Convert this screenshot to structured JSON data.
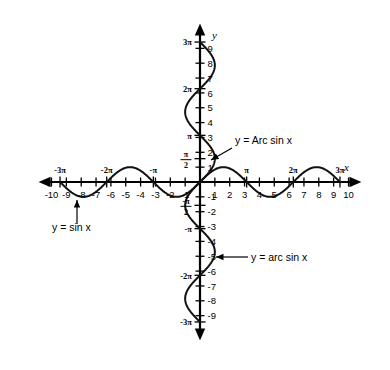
{
  "figure": {
    "background_color": "#ffffff",
    "curve_color": "#111111",
    "axis_color": "#000000"
  },
  "axes": {
    "x_axis_label": "x",
    "y_axis_label": "y",
    "x_range": [
      -10.8,
      10.8
    ],
    "y_range": [
      -10.6,
      10.6
    ],
    "x_integer_ticks": [
      -10,
      -9,
      -8,
      -7,
      -6,
      -5,
      -4,
      -3,
      -2,
      -1,
      1,
      2,
      3,
      4,
      5,
      6,
      7,
      8,
      9,
      10
    ],
    "y_integer_ticks": [
      -9,
      -8,
      -7,
      -6,
      -5,
      -4,
      -3,
      -2,
      -1,
      1,
      2,
      3,
      4,
      5,
      6,
      7,
      8,
      9
    ],
    "x_integer_tick_labels": [
      "-10",
      "-9",
      "-8",
      "-7",
      "-6",
      "-5",
      "-4",
      "-3",
      "-2",
      "-1",
      "1",
      "2",
      "3",
      "4",
      "5",
      "6",
      "7",
      "8",
      "9",
      "10"
    ],
    "y_integer_tick_labels": [
      "-9",
      "-8",
      "-7",
      "-6",
      "-5",
      "-4",
      "-3",
      "-2",
      "-1",
      "1",
      "2",
      "3",
      "4",
      "5",
      "6",
      "7",
      "8",
      "9"
    ],
    "x_pi_ticks": [
      {
        "value": -9.4248,
        "label": "-3π"
      },
      {
        "value": -6.2832,
        "label": "-2π"
      },
      {
        "value": -3.1416,
        "label": "-π"
      },
      {
        "value": 3.1416,
        "label": "π"
      },
      {
        "value": 6.2832,
        "label": "2π"
      },
      {
        "value": 9.4248,
        "label": "3π"
      }
    ],
    "y_pi_ticks": [
      {
        "value": -9.4248,
        "label": "-3π",
        "type": "plain"
      },
      {
        "value": -6.2832,
        "label": "-2π",
        "type": "plain"
      },
      {
        "value": -3.1416,
        "label": "-π",
        "type": "plain"
      },
      {
        "value": -1.5708,
        "label": "-π/2",
        "numerator": "-π",
        "denominator": "2",
        "type": "fraction"
      },
      {
        "value": 1.5708,
        "label": "π/2",
        "numerator": "π",
        "denominator": "2",
        "type": "fraction"
      },
      {
        "value": 3.1416,
        "label": "π",
        "type": "plain"
      },
      {
        "value": 6.2832,
        "label": "2π",
        "type": "plain"
      },
      {
        "value": 9.4248,
        "label": "3π",
        "type": "plain"
      }
    ]
  },
  "callouts": [
    {
      "id": "arcsin-principal",
      "text": "y = Arc sin x",
      "text_x": 235,
      "text_y": 144,
      "leader_from": [
        232,
        148
      ],
      "leader_to": [
        211,
        160
      ],
      "arrow_at": [
        211,
        160
      ],
      "arrow_angle": 150
    },
    {
      "id": "sine",
      "text": "y = sin x",
      "text_x": 52,
      "text_y": 231,
      "leader_from": [
        77,
        224
      ],
      "leader_to": [
        77,
        200
      ],
      "arrow_at": [
        77,
        200
      ],
      "arrow_angle": -90
    },
    {
      "id": "arcsin-relation",
      "text": "y = arc sin x",
      "text_x": 251,
      "text_y": 261,
      "leader_from": [
        248,
        257
      ],
      "leader_to": [
        216,
        257
      ],
      "arrow_at": [
        216,
        257
      ],
      "arrow_angle": 180
    }
  ],
  "chart_data": {
    "type": "line",
    "xlabel": "x",
    "ylabel": "y",
    "xlim": [
      -10.8,
      10.8
    ],
    "ylim": [
      -10.6,
      10.6
    ],
    "grid": false,
    "legend": "inline-callouts",
    "series": [
      {
        "name": "y = sin x",
        "equation": "y = sin x",
        "description": "Sine wave, amplitude 1, period 2π, drawn from x = -3π to x = 3π",
        "domain": [
          -9.4248,
          9.4248
        ],
        "range": [
          -1,
          1
        ],
        "amplitude": 1,
        "period": 6.2832,
        "key_points": [
          {
            "x": -9.4248,
            "y": 0
          },
          {
            "x": -7.854,
            "y": -1
          },
          {
            "x": -6.2832,
            "y": 0
          },
          {
            "x": -4.712,
            "y": 1
          },
          {
            "x": -3.1416,
            "y": 0
          },
          {
            "x": -1.5708,
            "y": -1
          },
          {
            "x": 0,
            "y": 0
          },
          {
            "x": 1.5708,
            "y": 1
          },
          {
            "x": 3.1416,
            "y": 0
          },
          {
            "x": 4.712,
            "y": -1
          },
          {
            "x": 6.2832,
            "y": 0
          },
          {
            "x": 7.854,
            "y": 1
          },
          {
            "x": 9.4248,
            "y": 0
          }
        ]
      },
      {
        "name": "y = arc sin x",
        "equation": "y = arc sin x",
        "description": "Full inverse relation: reflection of y = sin x across the line y = x, drawn from y = -3π to y = 3π",
        "domain": [
          -1,
          1
        ],
        "range": [
          -9.4248,
          9.4248
        ],
        "key_points": [
          {
            "x": 0,
            "y": -9.4248
          },
          {
            "x": -1,
            "y": -7.854
          },
          {
            "x": 0,
            "y": -6.2832
          },
          {
            "x": 1,
            "y": -4.712
          },
          {
            "x": 0,
            "y": -3.1416
          },
          {
            "x": -1,
            "y": -1.5708
          },
          {
            "x": 0,
            "y": 0
          },
          {
            "x": 1,
            "y": 1.5708
          },
          {
            "x": 0,
            "y": 3.1416
          },
          {
            "x": -1,
            "y": 4.712
          },
          {
            "x": 0,
            "y": 6.2832
          },
          {
            "x": 1,
            "y": 7.854
          },
          {
            "x": 0,
            "y": 9.4248
          }
        ]
      },
      {
        "name": "y = Arc sin x",
        "equation": "y = Arc sin x",
        "description": "Principal branch of the inverse sine, the portion of the relation with -π/2 ≤ y ≤ π/2",
        "domain": [
          -1,
          1
        ],
        "range": [
          -1.5708,
          1.5708
        ],
        "key_points": [
          {
            "x": -1,
            "y": -1.5708
          },
          {
            "x": 0,
            "y": 0
          },
          {
            "x": 1,
            "y": 1.5708
          }
        ]
      }
    ]
  }
}
